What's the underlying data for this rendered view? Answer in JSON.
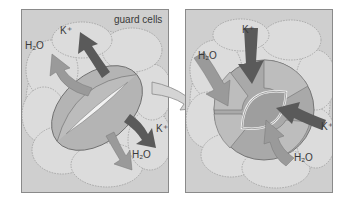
{
  "diagram": {
    "title_label": "guard cells",
    "panels": [
      {
        "id": "open-stoma",
        "labels": {
          "k_top": "K⁺",
          "h2o_top": "H₂O",
          "k_right": "K⁺",
          "h2o_bottom": "H₂O"
        },
        "arrows": [
          {
            "ion": "K⁺",
            "direction": "outward",
            "color": "#5a5a5a"
          },
          {
            "ion": "H₂O",
            "direction": "outward",
            "color": "#9a9a9a"
          },
          {
            "ion": "K⁺",
            "direction": "outward",
            "color": "#5a5a5a"
          },
          {
            "ion": "H₂O",
            "direction": "outward",
            "color": "#9a9a9a"
          }
        ]
      },
      {
        "id": "closed-stoma",
        "labels": {
          "k_top": "K⁺",
          "h2o_left": "H₂O",
          "k_right": "K⁺",
          "h2o_bottom": "H₂O"
        },
        "arrows": [
          {
            "ion": "K⁺",
            "direction": "inward",
            "color": "#5a5a5a"
          },
          {
            "ion": "H₂O",
            "direction": "inward",
            "color": "#9a9a9a"
          },
          {
            "ion": "K⁺",
            "direction": "inward",
            "color": "#5a5a5a"
          },
          {
            "ion": "H₂O",
            "direction": "inward",
            "color": "#9a9a9a"
          }
        ]
      }
    ],
    "colors": {
      "panel_bg": "#cfcfcf",
      "cell_fill": "#dcdcdc",
      "guard_cell_fill": "#b4b4b4",
      "k_arrow": "#5a5a5a",
      "h2o_arrow": "#9a9a9a"
    }
  }
}
